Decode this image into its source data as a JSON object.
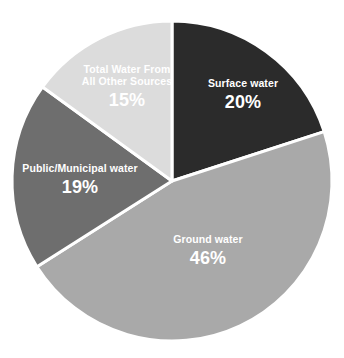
{
  "chart_data": {
    "type": "pie",
    "title": "",
    "subtitle": "",
    "xlabel": "",
    "ylabel": "",
    "legend_position": "none",
    "grid": false,
    "labels_inside_slices": true,
    "unit": "%",
    "total": 100,
    "categories": [
      "Surface water",
      "Ground water",
      "Public/Municipal water",
      "Total Water From All Other Sources"
    ],
    "values": [
      20,
      46,
      19,
      15
    ],
    "start_angle_deg": 0,
    "direction": "clockwise",
    "slices": [
      {
        "label": "Surface water",
        "label_line1": "Surface water",
        "label_line2": "",
        "value": 20,
        "value_text": "20%",
        "color": "#2b2b2b",
        "text_color": "#ffffff",
        "start_deg": 0,
        "end_deg": 72
      },
      {
        "label": "Ground water",
        "label_line1": "Ground water",
        "label_line2": "",
        "value": 46,
        "value_text": "46%",
        "color": "#a9a9a9",
        "text_color": "#ffffff",
        "start_deg": 72,
        "end_deg": 237.6
      },
      {
        "label": "Public/Municipal water",
        "label_line1": "Public/Municipal water",
        "label_line2": "",
        "value": 19,
        "value_text": "19%",
        "color": "#6e6e6e",
        "text_color": "#ffffff",
        "start_deg": 237.6,
        "end_deg": 306
      },
      {
        "label": "Total Water From All Other Sources",
        "label_line1": "Total Water From",
        "label_line2": "All Other Sources",
        "value": 15,
        "value_text": "15%",
        "color": "#dcdcdc",
        "text_color": "#ffffff",
        "start_deg": 306,
        "end_deg": 360
      }
    ]
  },
  "figure": {
    "background": "#ffffff",
    "separator_color": "#ffffff",
    "center_x": 172,
    "center_y": 181,
    "radius": 160
  }
}
